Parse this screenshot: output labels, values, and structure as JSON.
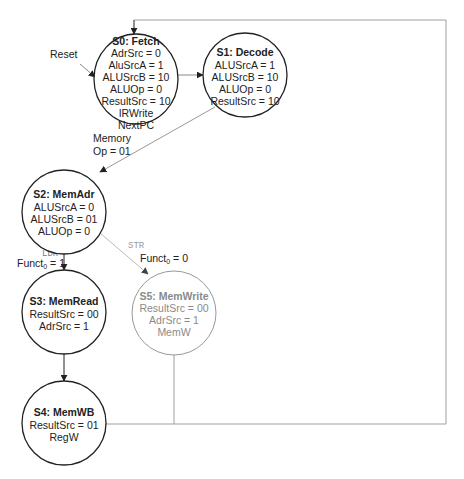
{
  "diagram": {
    "type": "finite-state-machine",
    "colors": {
      "active": "#222222",
      "dimmed": "#9a9a9a",
      "loop_line": "#a0a0a0"
    },
    "reset_label": "Reset",
    "states": [
      {
        "id": "S0",
        "title": "S0: Fetch",
        "lines": [
          "AdrSrc = 0",
          "AluSrcA = 1",
          "ALUSrcB = 10",
          "ALUOp = 0",
          "ResultSrc = 10",
          "IRWrite",
          "NextPC"
        ],
        "dimmed": false
      },
      {
        "id": "S1",
        "title": "S1: Decode",
        "lines": [
          "ALUSrcA = 1",
          "ALUSrcB = 10",
          "ALUOp = 0",
          "ResultSrc = 10"
        ],
        "dimmed": false
      },
      {
        "id": "S2",
        "title": "S2: MemAdr",
        "lines": [
          "ALUSrcA = 0",
          "ALUSrcB = 01",
          "ALUOp = 0"
        ],
        "dimmed": false
      },
      {
        "id": "S3",
        "title": "S3: MemRead",
        "lines": [
          "ResultSrc = 00",
          "AdrSrc = 1"
        ],
        "dimmed": false
      },
      {
        "id": "S4",
        "title": "S4: MemWB",
        "lines": [
          "ResultSrc = 01",
          "RegW"
        ],
        "dimmed": false
      },
      {
        "id": "S5",
        "title": "S5: MemWrite",
        "lines": [
          "ResultSrc = 00",
          "AdrSrc = 1",
          "MemW"
        ],
        "dimmed": true
      }
    ],
    "transitions": [
      {
        "from": "Reset",
        "to": "S0",
        "label": ""
      },
      {
        "from": "S0",
        "to": "S1",
        "label": ""
      },
      {
        "from": "S1",
        "to": "S2",
        "label_line1": "Memory",
        "label_line2": "Op = 01"
      },
      {
        "from": "S2",
        "to": "S3",
        "tag": "LDR",
        "label": "Funct",
        "subscript": "0",
        "value": " = 1"
      },
      {
        "from": "S2",
        "to": "S5",
        "tag": "STR",
        "label": "Funct",
        "subscript": "0",
        "value": " = 0",
        "dimmed": true
      },
      {
        "from": "S3",
        "to": "S4",
        "label": ""
      },
      {
        "from": "S4",
        "to": "S0",
        "label": ""
      },
      {
        "from": "S5",
        "to": "S0",
        "label": ""
      }
    ]
  }
}
